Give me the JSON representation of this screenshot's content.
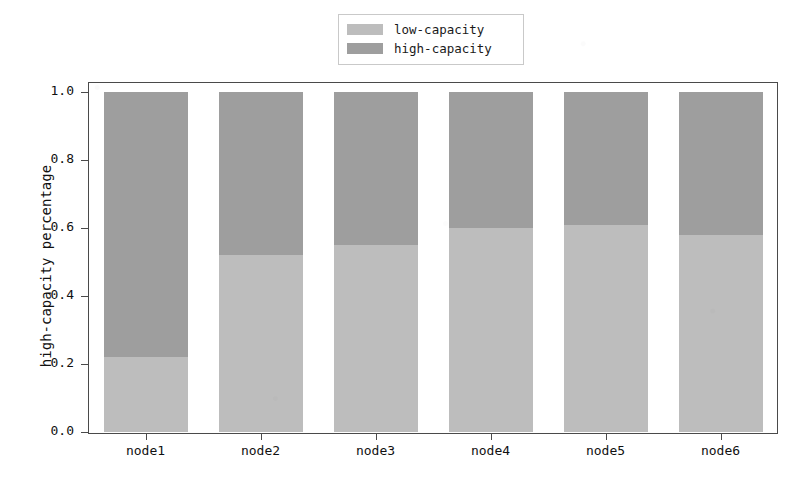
{
  "chart_data": {
    "type": "bar",
    "subtype": "stacked-bar-100-percent",
    "title": "",
    "subtitle": "",
    "xlabel": "",
    "ylabel": "high-capacity percentage",
    "categories": [
      "node1",
      "node2",
      "node3",
      "node4",
      "node5",
      "node6"
    ],
    "series": [
      {
        "name": "low-capacity",
        "color": "#bdbdbd",
        "values": [
          0.22,
          0.52,
          0.55,
          0.6,
          0.61,
          0.58
        ]
      },
      {
        "name": "high-capacity",
        "color": "#9e9e9e",
        "values": [
          0.78,
          0.48,
          0.45,
          0.4,
          0.39,
          0.42
        ]
      }
    ],
    "ylim": [
      0.0,
      1.0
    ],
    "yticks": [
      "0.0",
      "0.2",
      "0.4",
      "0.6",
      "0.8",
      "1.0"
    ],
    "ytick_values": [
      0.0,
      0.2,
      0.4,
      0.6,
      0.8,
      1.0
    ],
    "grid": false,
    "legend_position": "upper center (outside axes)",
    "annotations": []
  },
  "legend": {
    "entries": [
      {
        "label": "low-capacity",
        "color": "#bdbdbd",
        "swatch_icon": "color-swatch-icon"
      },
      {
        "label": "high-capacity",
        "color": "#9e9e9e",
        "swatch_icon": "color-swatch-icon"
      }
    ]
  },
  "axes": {
    "y_title": "high-capacity percentage",
    "y_tick_labels": [
      "1.0",
      "0.8",
      "0.6",
      "0.4",
      "0.2",
      "0.0"
    ],
    "x_tick_labels": [
      "node1",
      "node2",
      "node3",
      "node4",
      "node5",
      "node6"
    ]
  },
  "colors": {
    "low_capacity": "#bdbdbd",
    "high_capacity": "#9e9e9e",
    "axis": "#4a4a4a",
    "text": "#111111",
    "background": "#ffffff"
  }
}
